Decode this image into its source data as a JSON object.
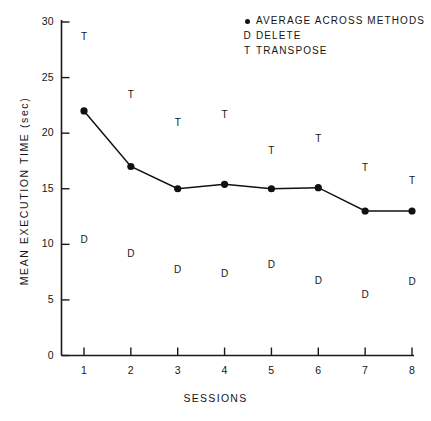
{
  "chart_data": {
    "type": "line",
    "title": "",
    "xlabel": "SESSIONS",
    "ylabel": "MEAN EXECUTION TIME (sec)",
    "xlim": [
      0.6,
      8.4
    ],
    "ylim": [
      0,
      30
    ],
    "x": [
      1,
      2,
      3,
      4,
      5,
      6,
      7,
      8
    ],
    "xtick_labels": [
      "1",
      "2",
      "3",
      "4",
      "5",
      "6",
      "7",
      "8"
    ],
    "ytick_labels": [
      "0",
      "5",
      "10",
      "15",
      "20",
      "25",
      "30"
    ],
    "yticks": [
      0,
      5,
      10,
      15,
      20,
      25,
      30
    ],
    "grid": false,
    "legend_position": "top-right",
    "series": [
      {
        "name": "AVERAGE ACROSS METHODS",
        "marker": "dot",
        "line": true,
        "values": [
          22.0,
          17.0,
          15.0,
          15.4,
          15.0,
          15.1,
          13.0,
          13.0
        ]
      },
      {
        "name": "DELETE",
        "marker": "D",
        "line": false,
        "values": [
          10.5,
          9.2,
          7.8,
          7.4,
          8.2,
          6.8,
          5.5,
          6.7
        ]
      },
      {
        "name": "TRANSPOSE",
        "marker": "T",
        "line": false,
        "values": [
          28.7,
          23.5,
          21.0,
          21.7,
          18.5,
          19.6,
          17.0,
          15.8
        ]
      }
    ]
  },
  "legend": {
    "entries": [
      {
        "marker": "dot",
        "label": "AVERAGE ACROSS METHODS"
      },
      {
        "marker": "D",
        "label": "DELETE"
      },
      {
        "marker": "T",
        "label": "TRANSPOSE"
      }
    ]
  },
  "axes": {
    "x_title": "SESSIONS",
    "y_title": "MEAN EXECUTION TIME (sec)"
  }
}
